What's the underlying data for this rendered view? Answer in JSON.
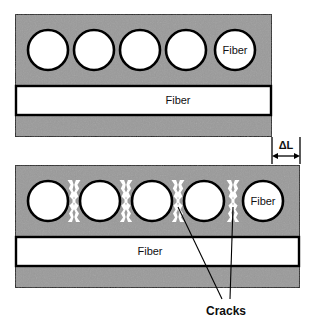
{
  "figure": {
    "title_visible": false,
    "background_color": "#ffffff",
    "matrix_color": "#9a9a9a",
    "fiber_color": "#ffffff",
    "outline_color": "#000000",
    "panels": [
      {
        "id": "undeformed",
        "name": "top-panel",
        "state": "undeformed",
        "matrix": {
          "x": 15,
          "y": 14,
          "width": 257,
          "height": 123
        },
        "transverse_fiber_row": {
          "count": 5,
          "radius": 20,
          "cy": 50,
          "centers_x": [
            48,
            94,
            140,
            186,
            235
          ],
          "labeled_index": 4,
          "label": "Fiber"
        },
        "longitudinal_fiber_band": {
          "x": 17,
          "y": 86,
          "width": 253,
          "height": 29,
          "label": "Fiber",
          "label_x": 178,
          "label_y": 101
        },
        "cracks": []
      },
      {
        "id": "deformed",
        "name": "bottom-panel",
        "state": "deformed-elongated",
        "matrix": {
          "x": 15,
          "y": 165,
          "width": 285,
          "height": 123
        },
        "transverse_fiber_row": {
          "count": 5,
          "radius": 20,
          "cy": 201,
          "centers_x": [
            48,
            100,
            152,
            204,
            263
          ],
          "labeled_index": 4,
          "label": "Fiber"
        },
        "longitudinal_fiber_band": {
          "x": 17,
          "y": 237,
          "width": 281,
          "height": 29,
          "label": "Fiber",
          "label_x": 150,
          "label_y": 252
        },
        "cracks": {
          "count": 4,
          "centers_x": [
            74,
            126,
            178,
            233
          ],
          "cy": 201,
          "half_height": 21,
          "label": "Cracks"
        }
      }
    ],
    "annotations": {
      "delta_l": {
        "label": "ΔL",
        "label_x": 282,
        "label_y": 146,
        "arrow_y": 156,
        "arrow_x1": 272,
        "arrow_x2": 300,
        "tick_top": 138,
        "tick_bottom": 163
      },
      "cracks_callout": {
        "label": "Cracks",
        "label_x": 226,
        "label_y": 311,
        "leader_lines": [
          {
            "x1": 178,
            "y1": 205,
            "x2": 222,
            "y2": 299
          },
          {
            "x1": 233,
            "y1": 205,
            "x2": 230,
            "y2": 299
          }
        ]
      }
    }
  }
}
